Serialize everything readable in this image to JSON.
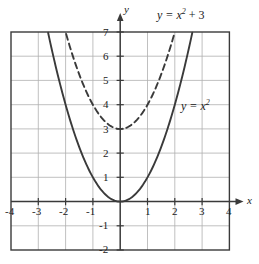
{
  "chart_data": {
    "type": "line",
    "title": "",
    "xlabel": "x",
    "ylabel": "y",
    "xlim": [
      -4,
      4
    ],
    "ylim": [
      -2,
      7
    ],
    "grid": true,
    "legend_position": "inline-annotations",
    "x_ticks": [
      "-4",
      "-3",
      "-2",
      "-1",
      "1",
      "2",
      "3",
      "4"
    ],
    "x_tick_values": [
      -4,
      -3,
      -2,
      -1,
      1,
      2,
      3,
      4
    ],
    "y_ticks": [
      "7",
      "6",
      "5",
      "4",
      "3",
      "2",
      "1",
      "-1",
      "-2"
    ],
    "y_tick_values": [
      7,
      6,
      5,
      4,
      3,
      2,
      1,
      -1,
      -2
    ],
    "series": [
      {
        "name": "y = x^2",
        "style": "solid",
        "color": "#3a3a3a",
        "expression": "y = x²",
        "vertex": [
          0,
          0
        ],
        "x": [
          -2.65,
          -2.4,
          -2.2,
          -2,
          -1.75,
          -1.5,
          -1.25,
          -1,
          -0.75,
          -0.5,
          -0.25,
          0,
          0.25,
          0.5,
          0.75,
          1,
          1.25,
          1.5,
          1.75,
          2,
          2.2,
          2.4,
          2.65
        ],
        "y": [
          7.02,
          5.76,
          4.84,
          4,
          3.06,
          2.25,
          1.56,
          1,
          0.56,
          0.25,
          0.06,
          0,
          0.06,
          0.25,
          0.56,
          1,
          1.56,
          2.25,
          3.06,
          4,
          4.84,
          5.76,
          7.02
        ]
      },
      {
        "name": "y = x^2 + 3",
        "style": "dashed",
        "color": "#3a3a3a",
        "expression": "y = x² + 3",
        "vertex": [
          0,
          3
        ],
        "x": [
          -2,
          -1.8,
          -1.6,
          -1.4,
          -1.2,
          -1,
          -0.8,
          -0.6,
          -0.4,
          -0.2,
          0,
          0.2,
          0.4,
          0.6,
          0.8,
          1,
          1.2,
          1.4,
          1.6,
          1.8,
          2
        ],
        "y": [
          7,
          6.24,
          5.56,
          4.96,
          4.44,
          4,
          3.64,
          3.36,
          3.16,
          3.04,
          3,
          3.04,
          3.16,
          3.36,
          3.64,
          4,
          4.44,
          4.96,
          5.56,
          6.24,
          7
        ]
      }
    ],
    "annotations": [
      {
        "text": "y = x² + 3",
        "base": "y = x",
        "exponent": "2",
        "suffix": " + 3",
        "at_x": 1.4,
        "at_y": 7.6
      },
      {
        "text": "y = x²",
        "base": "y = x",
        "exponent": "2",
        "suffix": "",
        "at_x": 2.35,
        "at_y": 4.0
      }
    ]
  },
  "axes": {
    "x_axis_label": "x",
    "y_axis_label": "y"
  },
  "colors": {
    "grid": "#b0b0b0",
    "frame": "#3a3a3a",
    "axis": "#3a3a3a",
    "curve": "#3a3a3a",
    "text": "#1a1a1a",
    "background": "#ffffff"
  },
  "labels": {
    "x_m4": "-4",
    "x_m3": "-3",
    "x_m2": "-2",
    "x_m1": "-1",
    "x_p1": "1",
    "x_p2": "2",
    "x_p3": "3",
    "x_p4": "4",
    "y_7": "7",
    "y_6": "6",
    "y_5": "5",
    "y_4": "4",
    "y_3": "3",
    "y_2": "2",
    "y_1": "1",
    "y_m1": "-1",
    "y_m2": "-2"
  }
}
